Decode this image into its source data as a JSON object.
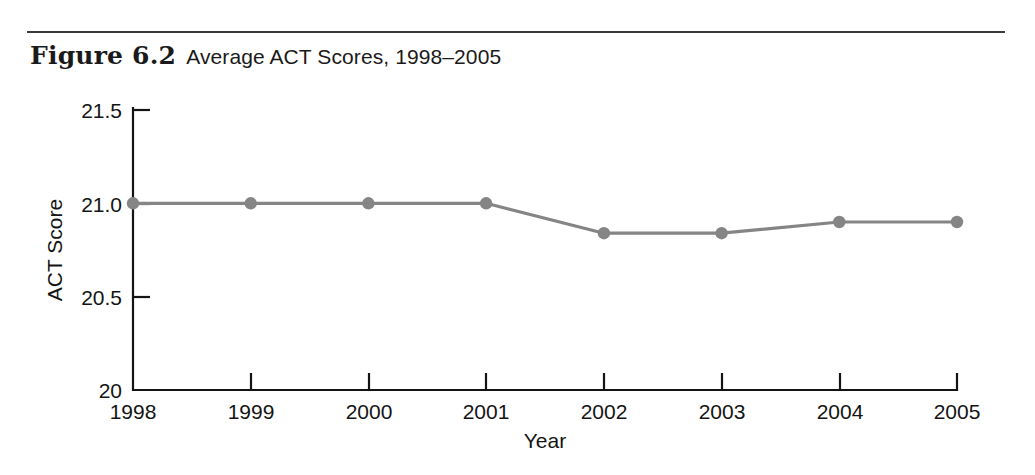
{
  "figure": {
    "number_label": "Figure 6.2",
    "title": "Average ACT Scores, 1998–2005"
  },
  "colors": {
    "series": "#858585",
    "axis": "#141414",
    "rule": "#3a3a3a",
    "background": "#ffffff"
  },
  "chart_data": {
    "type": "line",
    "title": "Average ACT Scores, 1998–2005",
    "xlabel": "Year",
    "ylabel": "ACT Score",
    "categories": [
      "1998",
      "1999",
      "2000",
      "2001",
      "2002",
      "2003",
      "2004",
      "2005"
    ],
    "values": [
      21.0,
      21.0,
      21.0,
      21.0,
      20.84,
      20.84,
      20.9,
      20.9
    ],
    "series": [
      {
        "name": "Average ACT Score",
        "values": [
          21.0,
          21.0,
          21.0,
          21.0,
          20.84,
          20.84,
          20.9,
          20.9
        ]
      }
    ],
    "ylim": [
      20,
      21.5
    ],
    "ytick_labels": [
      "20",
      "20.5",
      "21.0",
      "21.5"
    ],
    "ytick_values": [
      20,
      20.5,
      21.0,
      21.5
    ],
    "xtick_labels": [
      "1998",
      "1999",
      "2000",
      "2001",
      "2002",
      "2003",
      "2004",
      "2005"
    ],
    "grid": false,
    "legend": "none",
    "markers": "circle"
  }
}
